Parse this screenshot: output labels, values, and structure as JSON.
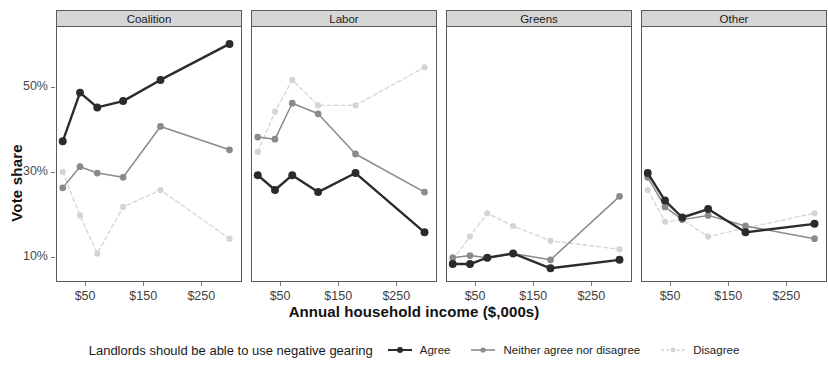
{
  "chart_data": {
    "type": "line",
    "title": "",
    "xlabel": "Annual household income ($,000s)",
    "ylabel": "Vote share",
    "legend_title": "Landlords should be able to use negative gearing",
    "legend_position": "bottom",
    "grid": false,
    "facet_variable": "party",
    "facets": [
      "Coalition",
      "Labor",
      "Greens",
      "Other"
    ],
    "x": [
      10,
      40,
      70,
      115,
      180,
      300
    ],
    "x_tick_values": [
      50,
      150,
      250
    ],
    "x_tick_labels": [
      "$50",
      "$150",
      "$250"
    ],
    "xlim": [
      0,
      320
    ],
    "y_tick_values": [
      10,
      30,
      50
    ],
    "y_tick_labels": [
      "10%",
      "30%",
      "50%"
    ],
    "ylim": [
      4,
      64
    ],
    "y_unit": "percent",
    "series_names": [
      "Agree",
      "Neither agree nor disagree",
      "Disagree"
    ],
    "series_colors": [
      "#2b2b2b",
      "#8c8c8c",
      "#d2d2d2"
    ],
    "series_linestyles": [
      "solid",
      "solid",
      "dashed"
    ],
    "panels": [
      {
        "name": "Coalition",
        "series": [
          {
            "name": "Agree",
            "values": [
              37.0,
              48.5,
              45.0,
              46.5,
              51.5,
              60.0
            ]
          },
          {
            "name": "Neither agree nor disagree",
            "values": [
              26.0,
              31.0,
              29.5,
              28.5,
              40.5,
              35.0
            ]
          },
          {
            "name": "Disagree",
            "values": [
              29.8,
              19.5,
              10.5,
              21.5,
              25.5,
              14.0
            ]
          }
        ]
      },
      {
        "name": "Labor",
        "series": [
          {
            "name": "Agree",
            "values": [
              29.0,
              25.5,
              29.0,
              25.0,
              29.5,
              15.5
            ]
          },
          {
            "name": "Neither agree nor disagree",
            "values": [
              38.0,
              37.5,
              46.0,
              43.5,
              34.0,
              25.0
            ]
          },
          {
            "name": "Disagree",
            "values": [
              34.5,
              44.0,
              51.5,
              45.5,
              45.5,
              54.5
            ]
          }
        ]
      },
      {
        "name": "Greens",
        "series": [
          {
            "name": "Agree",
            "values": [
              8.0,
              8.0,
              9.5,
              10.5,
              7.0,
              9.0
            ]
          },
          {
            "name": "Neither agree nor disagree",
            "values": [
              9.5,
              10.0,
              9.5,
              10.5,
              9.0,
              24.0
            ]
          },
          {
            "name": "Disagree",
            "values": [
              9.0,
              14.5,
              20.0,
              17.0,
              13.5,
              11.5
            ]
          }
        ]
      },
      {
        "name": "Other",
        "series": [
          {
            "name": "Agree",
            "values": [
              29.5,
              23.0,
              19.0,
              21.0,
              15.5,
              17.5
            ]
          },
          {
            "name": "Neither agree nor disagree",
            "values": [
              28.5,
              21.5,
              18.5,
              19.5,
              17.0,
              14.0
            ]
          },
          {
            "name": "Disagree",
            "values": [
              25.5,
              18.0,
              18.5,
              14.5,
              16.5,
              15.5,
              20.0
            ]
          }
        ]
      }
    ],
    "panels_disagree_override": {
      "Other": [
        25.5,
        18.0,
        18.5,
        14.5,
        16.5,
        20.0
      ]
    }
  },
  "axes": {
    "y_title": "Vote share",
    "x_title": "Annual household income ($,000s)",
    "y_ticks": [
      "50%",
      "30%",
      "10%"
    ],
    "x_ticks": [
      "$50",
      "$150",
      "$250"
    ]
  },
  "strips": {
    "coalition": "Coalition",
    "labor": "Labor",
    "greens": "Greens",
    "other": "Other"
  },
  "legend": {
    "title": "Landlords should be able to use negative gearing",
    "items": [
      {
        "label": "Agree",
        "color": "#2b2b2b",
        "style": "solid"
      },
      {
        "label": "Neither agree nor disagree",
        "color": "#8c8c8c",
        "style": "solid"
      },
      {
        "label": "Disagree",
        "color": "#d2d2d2",
        "style": "dashed"
      }
    ]
  }
}
